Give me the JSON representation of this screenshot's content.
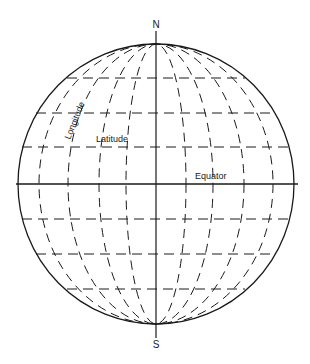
{
  "figure": {
    "labels": {
      "north": "N",
      "south": "S",
      "longitude": "Longitude",
      "latitude": "Latitude",
      "equator": "Equator"
    },
    "colors": {
      "line": "#1a1a1a",
      "background": "#ffffff"
    },
    "geometry": {
      "center": [
        156,
        184
      ],
      "radius_x": 138,
      "radius_y": 140,
      "meridian_rx": [
        30,
        57,
        88,
        117
      ],
      "parallels_y": [
        78,
        113,
        147,
        219,
        254,
        289
      ]
    }
  }
}
